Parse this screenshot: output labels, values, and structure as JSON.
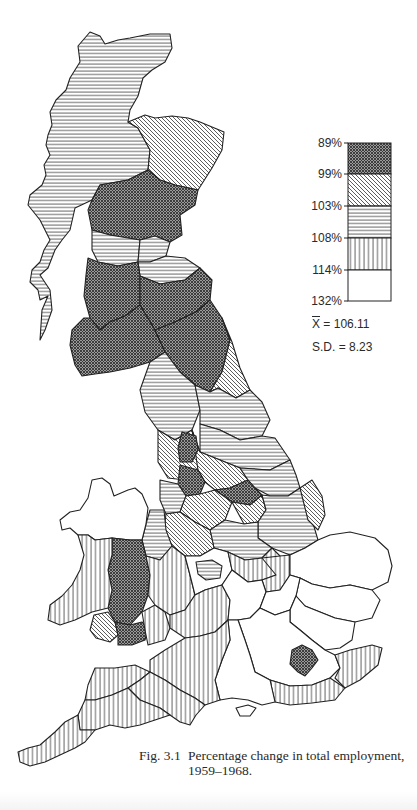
{
  "figure": {
    "number": "Fig. 3.1",
    "caption_line1": "Percentage change in total employment,",
    "caption_line2": "1959–1968."
  },
  "legend": {
    "breaks": [
      "89%",
      "99%",
      "103%",
      "108%",
      "114%",
      "132%"
    ],
    "classes": [
      {
        "range": "89%–99%",
        "pattern": "cross-hatch (dense, dark)"
      },
      {
        "range": "99%–103%",
        "pattern": "diagonal hatch"
      },
      {
        "range": "103%–108%",
        "pattern": "horizontal lines"
      },
      {
        "range": "108%–114%",
        "pattern": "vertical lines"
      },
      {
        "range": "114%–132%",
        "pattern": "blank (white)"
      }
    ]
  },
  "stats": {
    "mean_symbol": "X",
    "mean_value": "= 106.11",
    "sd_label": "S.D. = 8.23"
  },
  "map": {
    "subject": "Great Britain regions",
    "colors": {
      "ink": "#222222",
      "background": "#ffffff"
    }
  }
}
